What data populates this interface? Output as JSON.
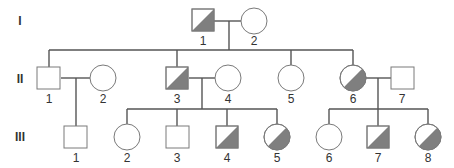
{
  "diagram": {
    "type": "pedigree",
    "colors": {
      "affected_fill": "#7f7f7f",
      "symbol_stroke": "#7a7a7a",
      "line": "#555555"
    },
    "generations": [
      {
        "label": "I",
        "y": 21
      },
      {
        "label": "II",
        "y": 79
      },
      {
        "label": "III",
        "y": 137
      }
    ],
    "individuals": [
      {
        "id": "I-1",
        "number": "1",
        "sex": "male",
        "carrier": true,
        "x": 203,
        "y": 20
      },
      {
        "id": "I-2",
        "number": "2",
        "sex": "female",
        "carrier": false,
        "x": 254,
        "y": 21
      },
      {
        "id": "II-1",
        "number": "1",
        "sex": "male",
        "carrier": false,
        "x": 49,
        "y": 78
      },
      {
        "id": "II-2",
        "number": "2",
        "sex": "female",
        "carrier": false,
        "x": 103,
        "y": 78
      },
      {
        "id": "II-3",
        "number": "3",
        "sex": "male",
        "carrier": true,
        "x": 177,
        "y": 78
      },
      {
        "id": "II-4",
        "number": "4",
        "sex": "female",
        "carrier": false,
        "x": 228,
        "y": 78
      },
      {
        "id": "II-5",
        "number": "5",
        "sex": "female",
        "carrier": false,
        "x": 291,
        "y": 78
      },
      {
        "id": "II-6",
        "number": "6",
        "sex": "female",
        "carrier": true,
        "x": 353,
        "y": 78
      },
      {
        "id": "II-7",
        "number": "7",
        "sex": "male",
        "carrier": false,
        "x": 402,
        "y": 78
      },
      {
        "id": "III-1",
        "number": "1",
        "sex": "male",
        "carrier": false,
        "x": 76,
        "y": 137
      },
      {
        "id": "III-2",
        "number": "2",
        "sex": "female",
        "carrier": false,
        "x": 127,
        "y": 137
      },
      {
        "id": "III-3",
        "number": "3",
        "sex": "male",
        "carrier": false,
        "x": 177,
        "y": 137
      },
      {
        "id": "III-4",
        "number": "4",
        "sex": "male",
        "carrier": true,
        "x": 227,
        "y": 137
      },
      {
        "id": "III-5",
        "number": "5",
        "sex": "female",
        "carrier": true,
        "x": 277,
        "y": 137
      },
      {
        "id": "III-6",
        "number": "6",
        "sex": "female",
        "carrier": false,
        "x": 329,
        "y": 137
      },
      {
        "id": "III-7",
        "number": "7",
        "sex": "male",
        "carrier": true,
        "x": 378,
        "y": 137
      },
      {
        "id": "III-8",
        "number": "8",
        "sex": "female",
        "carrier": true,
        "x": 428,
        "y": 137
      }
    ]
  }
}
